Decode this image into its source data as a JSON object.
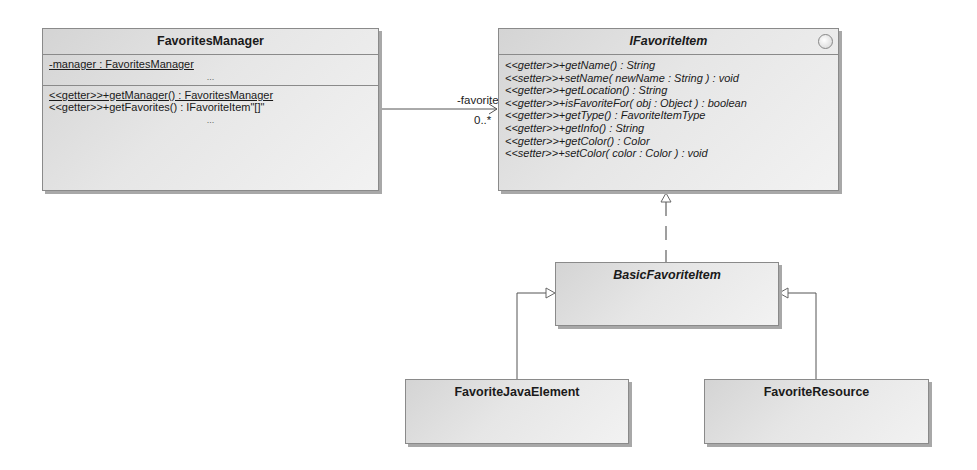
{
  "diagram": {
    "type": "UML class diagram",
    "classes": {
      "favorites_manager": {
        "name": "FavoritesManager",
        "attributes": [
          "-manager : FavoritesManager"
        ],
        "attributes_more": "...",
        "operations": [
          "<<getter>>+getManager() : FavoritesManager",
          "<<getter>>+getFavorites() : IFavoriteItem\"[]\""
        ],
        "operations_more": "..."
      },
      "ifavorite_item": {
        "name": "IFavoriteItem",
        "stereotype_icon": "interface-circle-icon",
        "operations": [
          "<<getter>>+getName() : String",
          "<<setter>>+setName( newName : String ) : void",
          "<<getter>>+getLocation() : String",
          "<<getter>>+isFavoriteFor( obj : Object ) : boolean",
          "<<getter>>+getType() : FavoriteItemType",
          "<<getter>>+getInfo() : String",
          "<<getter>>+getColor() : Color",
          "<<setter>>+setColor( color : Color ) : void"
        ]
      },
      "basic_favorite_item": {
        "name": "BasicFavoriteItem"
      },
      "favorite_java_element": {
        "name": "FavoriteJavaElement"
      },
      "favorite_resource": {
        "name": "FavoriteResource"
      }
    },
    "relations": {
      "association": {
        "from": "FavoritesManager",
        "to": "IFavoriteItem",
        "role": "-favorites",
        "multiplicity": "0..*"
      },
      "realization": {
        "from": "BasicFavoriteItem",
        "to": "IFavoriteItem"
      },
      "generalization_left": {
        "from": "FavoriteJavaElement",
        "to": "BasicFavoriteItem"
      },
      "generalization_right": {
        "from": "FavoriteResource",
        "to": "BasicFavoriteItem"
      }
    },
    "colors": {
      "box_border": "#8a8a8a",
      "box_fill_dark": "#d4d4d4",
      "box_fill_light": "#f2f2f2",
      "shadow": "#a8a8a8",
      "line": "#555555"
    }
  }
}
